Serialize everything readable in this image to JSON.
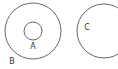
{
  "diagram": {
    "type": "venn-sets",
    "stroke_color": "#555555",
    "sets": [
      {
        "id": "B",
        "label": "B",
        "cx": 33,
        "cy": 31,
        "r": 28,
        "label_x": 12,
        "label_y": 64
      },
      {
        "id": "A",
        "label": "A",
        "cx": 33,
        "cy": 31,
        "r": 9,
        "label_x": 33,
        "label_y": 49,
        "inside": "B"
      },
      {
        "id": "C",
        "label": "C",
        "cx": 104,
        "cy": 31,
        "r": 27,
        "label_x": 87,
        "label_y": 30
      }
    ]
  }
}
